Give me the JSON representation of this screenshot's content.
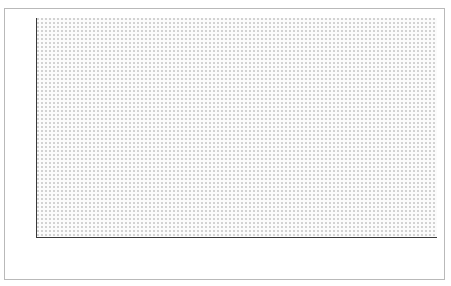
{
  "figure": {
    "title": "",
    "frame_color": "#b9b9b9",
    "background": "#ffffff"
  },
  "chart_data": {
    "type": "area",
    "stacked": true,
    "title": "",
    "subtitle": "",
    "xlabel": "",
    "ylabel": "",
    "ylim": [
      0,
      100
    ],
    "xlim": [
      1965,
      2007
    ],
    "grid": false,
    "legend_position": "in-plot-labels",
    "y_ticks": [
      0,
      10,
      20,
      30,
      40,
      50,
      60,
      70,
      80,
      90,
      100
    ],
    "x_tick_labels": [
      "1965",
      "1975",
      "1979",
      "1981",
      "1983",
      "1985",
      "1987",
      "1989",
      "1991",
      "1993",
      "1995",
      "1997",
      "1999",
      "2001",
      "2003",
      "2005",
      "2007"
    ],
    "x": [
      1965,
      1966,
      1967,
      1968,
      1969,
      1970,
      1971,
      1972,
      1973,
      1974,
      1975,
      1976,
      1977,
      1978,
      1979,
      1980,
      1981,
      1982,
      1983,
      1984,
      1985,
      1986,
      1987,
      1988,
      1989,
      1990,
      1991,
      1992,
      1993,
      1994,
      1995,
      1996,
      1997,
      1998,
      1999,
      2000,
      2001,
      2002,
      2003,
      2004,
      2005,
      2006,
      2007
    ],
    "series": [
      {
        "name": "Out-of-Pocket",
        "color": "#a8a8a8",
        "texture": "fine-dither",
        "values": [
          16.0,
          15.6,
          15.2,
          16.3,
          17.5,
          18.6,
          19.3,
          19.8,
          20.3,
          20.6,
          20.8,
          20.9,
          21.2,
          21.5,
          21.8,
          22.2,
          22.6,
          22.9,
          22.2,
          25.9,
          29.9,
          31.5,
          30.7,
          26.4,
          28.3,
          29.8,
          31.3,
          33.0,
          34.8,
          36.4,
          38.0,
          39.4,
          41.0,
          43.8,
          46.4,
          48.4,
          50.6,
          52.6,
          55.0,
          56.9,
          59.6,
          57.4,
          55.6
        ]
      },
      {
        "name": "Social Insurance",
        "color": "#4b4b4b",
        "texture": "solid-dark",
        "values": [
          56.0,
          56.2,
          56.4,
          55.2,
          53.6,
          52.4,
          51.9,
          51.2,
          48.6,
          47.4,
          46.5,
          46.1,
          45.7,
          44.2,
          42.4,
          40.4,
          39.5,
          38.7,
          40.2,
          36.8,
          32.7,
          30.4,
          31.2,
          35.0,
          37.8,
          40.2,
          42.2,
          43.6,
          44.5,
          45.3,
          45.6,
          45.5,
          44.6,
          42.4,
          39.8,
          38.3,
          35.5,
          33.5,
          31.0,
          29.2,
          25.8,
          27.3,
          26.3
        ]
      },
      {
        "name": "Government",
        "color": "#fbfbfb",
        "texture": "dotted-light",
        "values": [
          28.0,
          28.2,
          28.4,
          28.5,
          28.9,
          29.0,
          28.8,
          29.0,
          31.1,
          32.0,
          32.7,
          33.0,
          33.1,
          34.3,
          35.8,
          37.4,
          37.9,
          38.4,
          37.6,
          37.3,
          37.4,
          38.1,
          38.1,
          38.6,
          33.9,
          30.0,
          26.5,
          23.4,
          20.7,
          18.3,
          16.4,
          15.1,
          14.4,
          13.8,
          13.8,
          13.3,
          13.9,
          13.9,
          14.0,
          13.9,
          14.6,
          15.3,
          18.1
        ]
      }
    ],
    "band_labels": [
      {
        "id": "government-label",
        "text": "Government",
        "x_pct": 56.5,
        "y_pct": 12.0,
        "boxed": false
      },
      {
        "id": "social-insurance-label",
        "text": "Social Insurance",
        "x_pct": 60.0,
        "y_pct": 35.5,
        "boxed": true
      },
      {
        "id": "out-of-pocket-label",
        "text": "Out-of-Pocket",
        "x_pct": 61.5,
        "y_pct": 76.5,
        "boxed": true
      }
    ],
    "annotations": [
      {
        "id": "annotation-16",
        "text": "16%",
        "x_pct": 7.5,
        "y_pct": 69.5
      },
      {
        "id": "annotation-264",
        "text": "26.4%",
        "x_pct": 40.0,
        "y_pct": 51.0
      },
      {
        "id": "annotation-60",
        "text": "60%",
        "x_pct": 82.5,
        "y_pct": 29.0
      },
      {
        "id": "annotation-452",
        "text": "45.2%",
        "x_pct": 92.0,
        "y_pct": 53.0
      }
    ],
    "reference_lines": [
      {
        "id": "reference-line-1986",
        "x_pct": 31.7,
        "color": "#55565a"
      },
      {
        "id": "reference-line-2001",
        "x_pct": 81.3,
        "color": "#55565a"
      }
    ]
  }
}
